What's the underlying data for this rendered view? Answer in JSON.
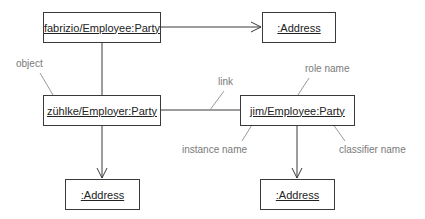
{
  "diagram": {
    "type": "UML object diagram",
    "objects": [
      {
        "id": "fabrizio",
        "label": "fabrizio/Employee:Party"
      },
      {
        "id": "address_top",
        "label": ":Address"
      },
      {
        "id": "zuhlke",
        "label": "zühlke/Employer:Party"
      },
      {
        "id": "jim",
        "label": "jim/Employee:Party"
      },
      {
        "id": "address_left",
        "label": ":Address"
      },
      {
        "id": "address_right",
        "label": ":Address"
      }
    ],
    "links": [
      {
        "from": "fabrizio",
        "to": "address_top",
        "navigable": true
      },
      {
        "from": "fabrizio",
        "to": "zuhlke",
        "navigable": false
      },
      {
        "from": "zuhlke",
        "to": "jim",
        "navigable": false
      },
      {
        "from": "zuhlke",
        "to": "address_left",
        "navigable": true
      },
      {
        "from": "jim",
        "to": "address_right",
        "navigable": true
      }
    ],
    "annotations": {
      "object": "object",
      "link": "link",
      "role_name": "role name",
      "instance_name": "instance name",
      "classifier_name": "classifier name"
    },
    "colors": {
      "line": "#3a3a3a",
      "annotation": "#7a7a7a"
    }
  }
}
